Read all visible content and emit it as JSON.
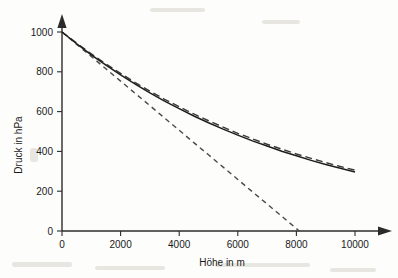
{
  "chart_data": {
    "type": "line",
    "title": "",
    "xlabel": "Höhe in m",
    "ylabel": "Druck in hPa",
    "xlim": [
      0,
      10000
    ],
    "ylim": [
      0,
      1000
    ],
    "xticks": [
      0,
      2000,
      4000,
      6000,
      8000,
      10000
    ],
    "yticks": [
      0,
      200,
      400,
      600,
      800,
      1000
    ],
    "xtick_labels": [
      "0",
      "2000",
      "4000",
      "6000",
      "8000",
      "10000"
    ],
    "ytick_labels": [
      "0",
      "200",
      "400",
      "600",
      "800",
      "1000"
    ],
    "grid": false,
    "legend": "none",
    "x": [
      0,
      500,
      1000,
      1500,
      2000,
      2500,
      3000,
      3500,
      4000,
      4500,
      5000,
      5500,
      6000,
      6500,
      7000,
      7500,
      8000,
      8500,
      9000,
      9500,
      10000
    ],
    "series": [
      {
        "name": "barometrische Höhenformel (exakt)",
        "style": "solid",
        "values": [
          1000,
          941,
          885,
          833,
          784,
          738,
          694,
          653,
          615,
          578,
          544,
          512,
          482,
          453,
          427,
          401,
          378,
          355,
          334,
          315,
          296
        ]
      },
      {
        "name": "Näherung (Approximation)",
        "style": "long-dashed",
        "values": [
          1000,
          944,
          890,
          840,
          792,
          746,
          703,
          662,
          624,
          588,
          554,
          522,
          491,
          463,
          436,
          411,
          387,
          365,
          344,
          324,
          306
        ]
      },
      {
        "name": "lineare Näherung (Tangente)",
        "style": "short-dashed",
        "values": [
          1000,
          938,
          877,
          815,
          753,
          691,
          630,
          568,
          506,
          444,
          383,
          321,
          259,
          197,
          136,
          74,
          12,
          0,
          0,
          0,
          0
        ],
        "zero_crossing_x": 8100
      }
    ]
  },
  "axes": {
    "y_axis_name": "pressure-axis",
    "x_axis_name": "altitude-axis"
  }
}
